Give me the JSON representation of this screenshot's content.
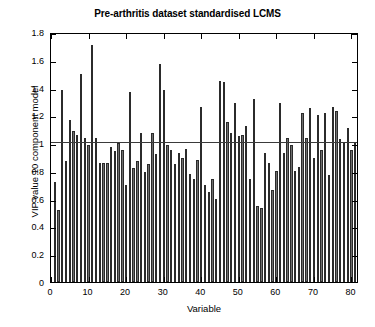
{
  "chart_data": {
    "type": "bar",
    "title": "Pre-arthritis dataset standardised LCMS",
    "xlabel": "Variable",
    "ylabel": "VIP value 10 component model",
    "xlim": [
      0,
      82
    ],
    "ylim": [
      0,
      1.8
    ],
    "ytick_labels": [
      "0",
      "0.2",
      "0.4",
      "0.6",
      "0.8",
      "1",
      "1.2",
      "1.4",
      "1.6",
      "1.8"
    ],
    "ytick_values": [
      0,
      0.2,
      0.4,
      0.6,
      0.8,
      1,
      1.2,
      1.4,
      1.6,
      1.8
    ],
    "xtick_labels": [
      "0",
      "10",
      "20",
      "30",
      "40",
      "50",
      "60",
      "70",
      "80"
    ],
    "xtick_values": [
      0,
      10,
      20,
      30,
      40,
      50,
      60,
      70,
      80
    ],
    "grid": false,
    "legend": "none",
    "bar_fill_color": "#6e6e6e",
    "bar_edge_color": "#2b2b2b",
    "reference_line": {
      "y": 1,
      "color": "#3a3a3a",
      "label": "VIP = 1"
    },
    "categories": [
      1,
      2,
      3,
      4,
      5,
      6,
      7,
      8,
      9,
      10,
      11,
      12,
      13,
      14,
      15,
      16,
      17,
      18,
      19,
      20,
      21,
      22,
      23,
      24,
      25,
      26,
      27,
      28,
      29,
      30,
      31,
      32,
      33,
      34,
      35,
      36,
      37,
      38,
      39,
      40,
      41,
      42,
      43,
      44,
      45,
      46,
      47,
      48,
      49,
      50,
      51,
      52,
      53,
      54,
      55,
      56,
      57,
      58,
      59,
      60,
      61,
      62,
      63,
      64,
      65,
      66,
      67,
      68,
      69,
      70,
      71,
      72,
      73,
      74,
      75,
      76,
      77,
      78,
      79,
      80,
      81
    ],
    "values": [
      0.72,
      0.52,
      1.38,
      0.87,
      1.17,
      1.09,
      1.06,
      1.5,
      1.04,
      0.99,
      1.71,
      1.04,
      0.86,
      0.86,
      0.86,
      0.97,
      0.94,
      1.0,
      0.95,
      0.7,
      1.37,
      0.82,
      0.87,
      1.07,
      0.79,
      0.85,
      1.07,
      0.92,
      1.57,
      1.38,
      0.99,
      0.95,
      0.85,
      0.93,
      0.89,
      0.96,
      0.78,
      0.74,
      0.88,
      1.26,
      0.7,
      0.65,
      0.74,
      0.6,
      1.45,
      1.44,
      1.15,
      1.07,
      1.29,
      1.05,
      1.06,
      1.12,
      0.74,
      1.32,
      0.55,
      0.53,
      0.93,
      0.86,
      0.66,
      0.8,
      1.29,
      0.93,
      1.04,
      0.99,
      0.8,
      0.83,
      1.22,
      1.04,
      1.25,
      0.89,
      1.2,
      0.95,
      1.22,
      0.77,
      1.26,
      1.23,
      1.03,
      1.0,
      1.11,
      0.95,
      1.0
    ]
  }
}
